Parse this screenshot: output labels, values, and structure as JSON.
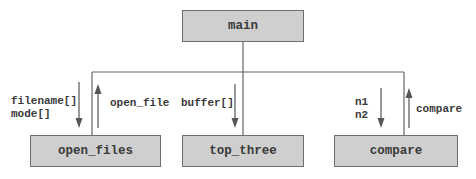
{
  "diagram": {
    "type": "structure-chart",
    "root": {
      "label": "main"
    },
    "children": [
      {
        "label": "open_files",
        "down_params": [
          "filename[]",
          "mode[]"
        ],
        "up_returns": [
          "open_file"
        ]
      },
      {
        "label": "top_three",
        "down_params": [
          "buffer[]"
        ],
        "up_returns": []
      },
      {
        "label": "compare",
        "down_params": [
          "n1",
          "n2"
        ],
        "up_returns": [
          "compare"
        ]
      }
    ],
    "labels": {
      "open_files_down": "filename[]\nmode[]",
      "open_files_up": "open_file",
      "top_three_down": "buffer[]",
      "compare_down": "n1\nn2",
      "compare_up": "compare"
    },
    "colors": {
      "box_fill": "#cfcfcf",
      "box_border": "#6e6e6e",
      "line": "#555555",
      "text": "#3a3a3a"
    }
  }
}
